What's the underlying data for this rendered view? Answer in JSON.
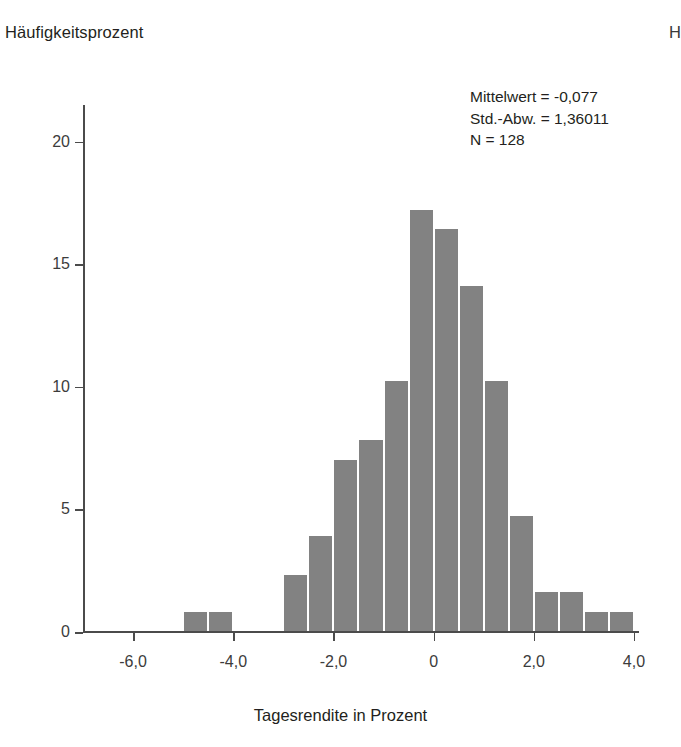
{
  "figure": {
    "y_axis_title": "Häufigkeitsprozent",
    "x_axis_title": "Tagesrendite in Prozent",
    "edge_fragment": "H",
    "bar_color": "#828282",
    "axis_color": "#4b4b4b",
    "text_color": "#231f20"
  },
  "stats": {
    "mean_line": "Mittelwert = -0,077",
    "sd_line": "Std.-Abw. = 1,36011",
    "n_line": "N = 128"
  },
  "chart_data": {
    "type": "bar",
    "title": "",
    "subtitle": "",
    "xlabel": "Tagesrendite in Prozent",
    "ylabel": "Häufigkeitsprozent",
    "xlim": [
      -7.0,
      4.1
    ],
    "ylim": [
      0,
      21.5
    ],
    "grid": false,
    "legend": null,
    "bin_width": 0.5,
    "x_ticks": [
      -6.0,
      -4.0,
      -2.0,
      0.0,
      2.0,
      4.0
    ],
    "x_tick_labels": [
      "-6,0",
      "-4,0",
      "-2,0",
      "0",
      "2,0",
      "4,0"
    ],
    "y_ticks": [
      0,
      5,
      10,
      15,
      20
    ],
    "y_tick_labels": [
      "0",
      "5",
      "10",
      "15",
      "20"
    ],
    "bin_centers": [
      -4.75,
      -4.25,
      -2.75,
      -2.25,
      -1.75,
      -1.25,
      -0.75,
      -0.25,
      0.25,
      0.75,
      1.25,
      1.75,
      2.25,
      2.75,
      3.25,
      3.75
    ],
    "bin_starts": [
      -5.0,
      -4.5,
      -3.0,
      -2.5,
      -2.0,
      -1.5,
      -1.0,
      -0.5,
      0.0,
      0.5,
      1.0,
      1.5,
      2.0,
      2.5,
      3.0,
      3.5
    ],
    "values": [
      0.8,
      0.8,
      2.3,
      3.9,
      7.0,
      7.8,
      10.2,
      17.2,
      16.4,
      14.1,
      10.2,
      4.7,
      1.6,
      1.6,
      0.8,
      0.8
    ],
    "annotations": [
      "Mittelwert = -0,077",
      "Std.-Abw. = 1,36011",
      "N = 128"
    ]
  }
}
